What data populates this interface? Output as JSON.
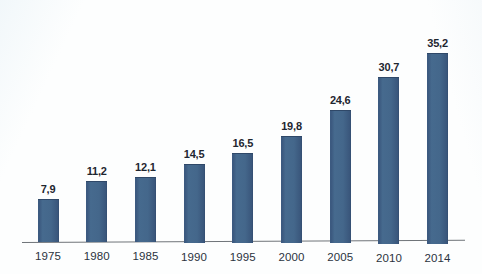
{
  "chart_data": {
    "type": "bar",
    "title": "",
    "subtitle": "",
    "xlabel": "",
    "ylabel": "",
    "categories": [
      "1975",
      "1980",
      "1985",
      "1990",
      "1995",
      "2000",
      "2005",
      "2010",
      "2014"
    ],
    "values": [
      7.9,
      11.2,
      12.1,
      14.5,
      16.5,
      19.8,
      24.6,
      30.7,
      35.2
    ],
    "value_labels": [
      "7,9",
      "11,2",
      "12,1",
      "14,5",
      "16,5",
      "19,8",
      "24,6",
      "30,7",
      "35,2"
    ],
    "decimal_separator": ",",
    "series": [
      {
        "name": "",
        "values": [
          7.9,
          11.2,
          12.1,
          14.5,
          16.5,
          19.8,
          24.6,
          30.7,
          35.2
        ]
      }
    ],
    "ylim": [
      0,
      37
    ],
    "grid": false,
    "legend": false,
    "legend_position": "none",
    "axis_visible": {
      "x": true,
      "y": false
    },
    "bar_color": "#44678b",
    "bar_edge_color": "#2f4868",
    "axis_color": "#6f7479",
    "label_color": "#1f2630",
    "category_label_color": "#2b3340",
    "background_color": "#fdfefe",
    "data_labels_shown": true,
    "annotations": []
  }
}
